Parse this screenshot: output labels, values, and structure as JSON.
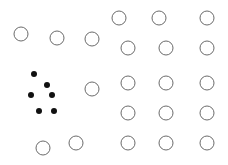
{
  "figure": {
    "title": "",
    "width": 228,
    "height": 165,
    "background_color": "#ffffff"
  },
  "chart_data": {
    "type": "scatter",
    "title": "",
    "xlabel": "",
    "ylabel": "",
    "xlim": [
      0,
      228
    ],
    "ylim": [
      165,
      0
    ],
    "grid": false,
    "legend_position": "none",
    "axes_visible": false,
    "tick_labels": {
      "x": [],
      "y": []
    },
    "annotations": [],
    "series": [
      {
        "name": "open-circles",
        "marker": "circle-open",
        "marker_size": 14,
        "edge_color": "#6b6b6b",
        "face_color": "#ffffff",
        "edge_width": 1,
        "count": 20,
        "points": [
          {
            "x": 21,
            "y": 34
          },
          {
            "x": 57,
            "y": 38
          },
          {
            "x": 92,
            "y": 39
          },
          {
            "x": 119,
            "y": 18
          },
          {
            "x": 159,
            "y": 18
          },
          {
            "x": 207,
            "y": 18
          },
          {
            "x": 128,
            "y": 48
          },
          {
            "x": 166,
            "y": 48
          },
          {
            "x": 207,
            "y": 48
          },
          {
            "x": 92,
            "y": 89
          },
          {
            "x": 128,
            "y": 83
          },
          {
            "x": 166,
            "y": 83
          },
          {
            "x": 207,
            "y": 83
          },
          {
            "x": 128,
            "y": 113
          },
          {
            "x": 166,
            "y": 113
          },
          {
            "x": 207,
            "y": 113
          },
          {
            "x": 43,
            "y": 148
          },
          {
            "x": 76,
            "y": 143
          },
          {
            "x": 128,
            "y": 143
          },
          {
            "x": 166,
            "y": 143
          },
          {
            "x": 207,
            "y": 143
          }
        ]
      },
      {
        "name": "filled-dots",
        "marker": "circle-filled",
        "marker_size": 6,
        "edge_color": "#111111",
        "face_color": "#111111",
        "edge_width": 0,
        "count": 6,
        "points": [
          {
            "x": 34,
            "y": 74
          },
          {
            "x": 47,
            "y": 85
          },
          {
            "x": 31,
            "y": 95
          },
          {
            "x": 52,
            "y": 95
          },
          {
            "x": 39,
            "y": 111
          },
          {
            "x": 54,
            "y": 111
          }
        ]
      }
    ]
  }
}
